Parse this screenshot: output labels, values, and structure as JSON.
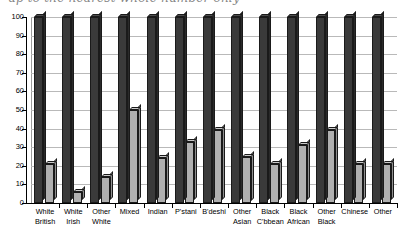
{
  "title": {
    "text": "up to the nearest whole number only",
    "visible": "partially-cropped"
  },
  "axes": {
    "y_ticks": [
      "100",
      "90",
      "80",
      "70",
      "60",
      "50",
      "40",
      "30",
      "20",
      "10",
      "0"
    ],
    "y_min": 0,
    "y_max": 100,
    "y_step": 10
  },
  "colors": {
    "series_dark": "#3a3a3a",
    "series_light": "#b0b0b0",
    "gridline": "#b9b9b9",
    "axis": "#000000",
    "background": "#ffffff"
  },
  "chart_data": {
    "type": "bar",
    "title": "up to the nearest whole number only",
    "xlabel": "",
    "ylabel": "",
    "ylim": [
      0,
      100
    ],
    "grid": true,
    "legend": "none",
    "categories": [
      "White British",
      "White Irish",
      "Other White",
      "Mixed",
      "Indian",
      "P'stani",
      "B'deshi",
      "Other Asian",
      "Black C'bbean",
      "Black African",
      "Other Black",
      "Chinese",
      "Other"
    ],
    "category_lines": [
      [
        "White",
        "British"
      ],
      [
        "White",
        "Irish"
      ],
      [
        "Other",
        "White"
      ],
      [
        "Mixed",
        ""
      ],
      [
        "Indian",
        ""
      ],
      [
        "P'stani",
        ""
      ],
      [
        "B'deshi",
        ""
      ],
      [
        "Other",
        "Asian"
      ],
      [
        "Black",
        "C'bbean"
      ],
      [
        "Black",
        "African"
      ],
      [
        "Other",
        "Black"
      ],
      [
        "Chinese",
        ""
      ],
      [
        "Other",
        ""
      ]
    ],
    "series": [
      {
        "name": "series-1",
        "color": "#3a3a3a",
        "values": [
          100,
          100,
          100,
          100,
          100,
          100,
          100,
          100,
          100,
          100,
          100,
          100,
          100
        ]
      },
      {
        "name": "series-2",
        "color": "#b0b0b0",
        "values": [
          21,
          6,
          14,
          50,
          24,
          33,
          39,
          25,
          21,
          31,
          39,
          21,
          21
        ]
      }
    ]
  }
}
